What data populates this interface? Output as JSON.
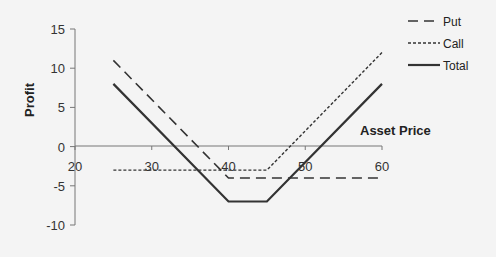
{
  "chart_data": {
    "type": "line",
    "title": "",
    "xlabel": "Asset Price",
    "ylabel": "Profit",
    "xlim": [
      20,
      60
    ],
    "ylim": [
      -10,
      15
    ],
    "x_ticks": [
      20,
      30,
      40,
      50,
      60
    ],
    "y_ticks": [
      15,
      10,
      5,
      0,
      -5,
      -10
    ],
    "grid": false,
    "legend_position": "top-right",
    "x": [
      25,
      40,
      45,
      60
    ],
    "series": [
      {
        "name": "Put",
        "style": "dashed",
        "values": [
          11,
          -4,
          -4,
          -4
        ]
      },
      {
        "name": "Call",
        "style": "dotted",
        "values": [
          -3,
          -3,
          -3,
          12
        ]
      },
      {
        "name": "Total",
        "style": "solid",
        "values": [
          8,
          -7,
          -7,
          8
        ]
      }
    ]
  }
}
